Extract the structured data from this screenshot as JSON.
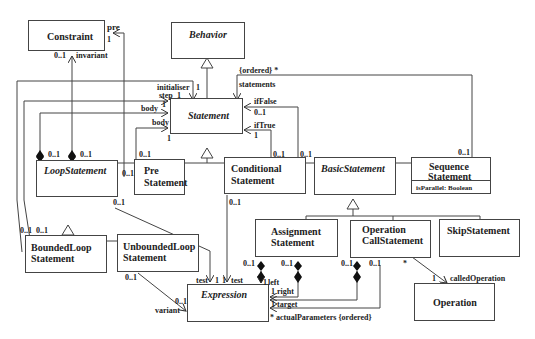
{
  "diagram": {
    "type": "uml-class-diagram",
    "classes": {
      "constraint": {
        "name": "Constraint"
      },
      "behavior": {
        "name": "Behavior",
        "abstract": true
      },
      "statement": {
        "name": "Statement",
        "abstract": true
      },
      "loop_statement": {
        "name": "LoopStatement",
        "abstract": true
      },
      "pre_statement": {
        "line1": "Pre",
        "line2": "Statement"
      },
      "conditional_statement": {
        "line1": "Conditional",
        "line2": "Statement"
      },
      "basic_statement": {
        "name": "BasicStatement",
        "abstract": true
      },
      "sequence_statement": {
        "line1": "Sequence",
        "line2": "Statement",
        "attribute": "isParallel: Boolean"
      },
      "bounded_loop_statement": {
        "line1": "BoundedLoop",
        "line2": "Statement"
      },
      "unbounded_loop_statement": {
        "line1": "UnboundedLoop",
        "line2": "Statement"
      },
      "assignment_statement": {
        "line1": "Assignment",
        "line2": "Statement"
      },
      "operation_call_statement": {
        "line1": "Operation",
        "line2": "CallStatement"
      },
      "skip_statement": {
        "name": "SkipStatement"
      },
      "expression": {
        "name": "Expression",
        "abstract": true
      },
      "operation": {
        "name": "Operation"
      }
    },
    "labels": {
      "pre": "pre",
      "pre_mult": "1",
      "invariant_mult": "0..1",
      "invariant": "invariant",
      "initialiser": "initialiser",
      "step": "step",
      "step_mult": "1",
      "initialiser_mult": "1",
      "body1": "body",
      "body1_mult": "1",
      "body2": "body",
      "body2_mult": "1",
      "ordered_star": "{ordered} *",
      "statements": "statements",
      "if_false": "ifFalse",
      "if_false_mult": "0..1",
      "if_true": "ifTrue",
      "if_true_mult": "1",
      "loop_mult_a": "0..1",
      "loop_mult_b": "0..1",
      "loop_bottom_mult": "0..1",
      "pre_top_mult": "0..1",
      "pre_left_mult": "0..1",
      "cond_mult_a": "0..1",
      "cond_mult_b": "0..1",
      "cond_bottom_mult": "0..1",
      "seq_mult": "0..1",
      "bounded_mult_a": "0..1",
      "bounded_mult_b": "0..1",
      "unbounded_mult": "0..1",
      "variant_mult": "0..1",
      "variant": "variant",
      "test_left": "test",
      "test_left_mult": "1",
      "test_right_mult": "1",
      "test_right": "test",
      "assign_mult_a": "0..1",
      "assign_mult_b": "0..1",
      "left_mult": "1",
      "left": "left",
      "right_mult": "1",
      "right": "right",
      "opcall_mult_a": "0..1",
      "opcall_mult_b": "0..1",
      "target_mult": "1",
      "target": "target",
      "actual_params": "* actualParameters  {ordered}",
      "opcall_star": "*",
      "called_op_mult": "1",
      "called_operation": "calledOperation"
    }
  }
}
